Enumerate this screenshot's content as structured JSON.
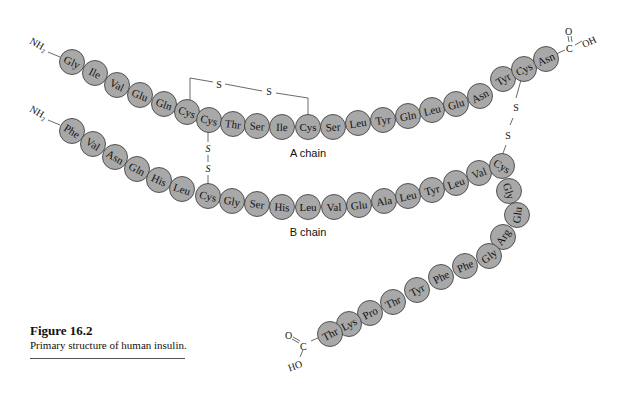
{
  "figure": {
    "title": "Figure 16.2",
    "caption": "Primary structure of human insulin."
  },
  "labels": {
    "a_chain": "A chain",
    "b_chain": "B chain",
    "nh2": "NH₂",
    "s": "S",
    "cooh_a": "O=C–OH",
    "cooh_b": "O=C–HO"
  },
  "a_chain": {
    "name": "A chain",
    "n_terminus": "NH2",
    "c_terminus": "COOH",
    "residues": [
      {
        "aa": "Gly",
        "x": 72,
        "y": 62
      },
      {
        "aa": "Ile",
        "x": 95,
        "y": 73
      },
      {
        "aa": "Val",
        "x": 117,
        "y": 85
      },
      {
        "aa": "Glu",
        "x": 140,
        "y": 95
      },
      {
        "aa": "Gln",
        "x": 164,
        "y": 104
      },
      {
        "aa": "Cys",
        "x": 187,
        "y": 112
      },
      {
        "aa": "Cys",
        "x": 209,
        "y": 120
      },
      {
        "aa": "Thr",
        "x": 233,
        "y": 124
      },
      {
        "aa": "Ser",
        "x": 257,
        "y": 126
      },
      {
        "aa": "Ile",
        "x": 282,
        "y": 127
      },
      {
        "aa": "Cys",
        "x": 308,
        "y": 127
      },
      {
        "aa": "Ser",
        "x": 333,
        "y": 127
      },
      {
        "aa": "Leu",
        "x": 358,
        "y": 123
      },
      {
        "aa": "Tyr",
        "x": 383,
        "y": 120
      },
      {
        "aa": "Gln",
        "x": 408,
        "y": 116
      },
      {
        "aa": "Leu",
        "x": 432,
        "y": 110
      },
      {
        "aa": "Glu",
        "x": 456,
        "y": 104
      },
      {
        "aa": "Asn",
        "x": 480,
        "y": 96
      },
      {
        "aa": "Tyr",
        "x": 503,
        "y": 79
      },
      {
        "aa": "Cys",
        "x": 524,
        "y": 69
      },
      {
        "aa": "Asn",
        "x": 546,
        "y": 59
      }
    ]
  },
  "b_chain": {
    "name": "B chain",
    "n_terminus": "NH2",
    "c_terminus": "COOH",
    "residues": [
      {
        "aa": "Phe",
        "x": 72,
        "y": 131
      },
      {
        "aa": "Val",
        "x": 93,
        "y": 144
      },
      {
        "aa": "Asn",
        "x": 115,
        "y": 157
      },
      {
        "aa": "Gln",
        "x": 137,
        "y": 169
      },
      {
        "aa": "His",
        "x": 159,
        "y": 180
      },
      {
        "aa": "Leu",
        "x": 182,
        "y": 189
      },
      {
        "aa": "Cys",
        "x": 208,
        "y": 196
      },
      {
        "aa": "Gly",
        "x": 232,
        "y": 201
      },
      {
        "aa": "Ser",
        "x": 257,
        "y": 204
      },
      {
        "aa": "His",
        "x": 282,
        "y": 207
      },
      {
        "aa": "Leu",
        "x": 308,
        "y": 207
      },
      {
        "aa": "Val",
        "x": 334,
        "y": 207
      },
      {
        "aa": "Glu",
        "x": 359,
        "y": 205
      },
      {
        "aa": "Ala",
        "x": 384,
        "y": 201
      },
      {
        "aa": "Leu",
        "x": 408,
        "y": 196
      },
      {
        "aa": "Tyr",
        "x": 432,
        "y": 190
      },
      {
        "aa": "Leu",
        "x": 456,
        "y": 183
      },
      {
        "aa": "Val",
        "x": 479,
        "y": 173
      },
      {
        "aa": "Cys",
        "x": 502,
        "y": 166
      },
      {
        "aa": "Gly",
        "x": 509,
        "y": 191
      },
      {
        "aa": "Glu",
        "x": 517,
        "y": 215
      },
      {
        "aa": "Arg",
        "x": 503,
        "y": 237
      },
      {
        "aa": "Gly",
        "x": 489,
        "y": 256
      },
      {
        "aa": "Phe",
        "x": 465,
        "y": 266
      },
      {
        "aa": "Phe",
        "x": 441,
        "y": 277
      },
      {
        "aa": "Tyr",
        "x": 417,
        "y": 290
      },
      {
        "aa": "Thr",
        "x": 393,
        "y": 302
      },
      {
        "aa": "Pro",
        "x": 370,
        "y": 313
      },
      {
        "aa": "Lys",
        "x": 349,
        "y": 324
      },
      {
        "aa": "Thr",
        "x": 330,
        "y": 334
      }
    ]
  },
  "disulfide_bonds": [
    {
      "from": "A6 Cys",
      "to": "A11 Cys",
      "type": "intrachain"
    },
    {
      "from": "A7 Cys",
      "to": "B7 Cys",
      "type": "interchain"
    },
    {
      "from": "A20 Cys",
      "to": "B19 Cys",
      "type": "interchain"
    }
  ]
}
